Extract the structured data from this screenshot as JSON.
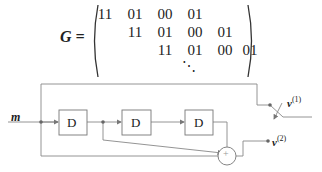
{
  "equation": {
    "lhs": "G",
    "equals": "=",
    "rows": [
      [
        "11",
        "01",
        "00",
        "01",
        "",
        ""
      ],
      [
        "",
        "11",
        "01",
        "00",
        "01",
        ""
      ],
      [
        "",
        "",
        "11",
        "01",
        "00",
        "01"
      ]
    ],
    "continuation": "⋱"
  },
  "diagram": {
    "input_label": "m",
    "delay_blocks": [
      "D",
      "D",
      "D"
    ],
    "adder_symbol": "+",
    "outputs": [
      {
        "label": "v",
        "superscript": "(1)"
      },
      {
        "label": "v",
        "superscript": "(2)"
      }
    ],
    "line_color": "#888888",
    "box_color": "#777777"
  }
}
